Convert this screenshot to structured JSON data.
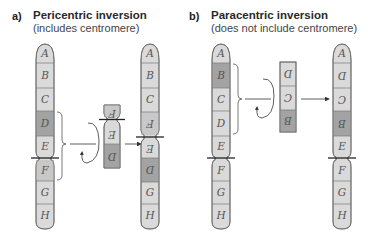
{
  "panels": [
    {
      "label": "a)",
      "title": "Pericentric inversion",
      "subtitle": "(includes centromere)"
    },
    {
      "label": "b)",
      "title": "Paracentric inversion",
      "subtitle": "(does not include centromere)"
    }
  ],
  "segments": {
    "A": "A",
    "B": "B",
    "C": "C",
    "D": "D",
    "E": "E",
    "F": "F",
    "G": "G",
    "H": "H"
  },
  "colors": {
    "light_segment": "#dadada",
    "dark_segment": "#a3a3a3",
    "outline": "#6a6a6a",
    "centromere_line": "#222222",
    "arrow": "#333333"
  }
}
